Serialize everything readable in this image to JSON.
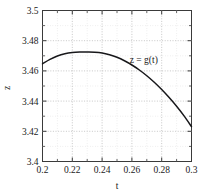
{
  "chart_data": {
    "type": "line",
    "title": "",
    "xlabel": "t",
    "ylabel": "z",
    "xlim": [
      0.2,
      0.3
    ],
    "ylim": [
      3.4,
      3.5
    ],
    "grid": true,
    "legend_position": "inside-right",
    "xticks": [
      "0.2",
      "0.22",
      "0.24",
      "0.26",
      "0.28",
      "0.3"
    ],
    "xtick_values": [
      0.2,
      0.22,
      0.24,
      0.26,
      0.28,
      0.3
    ],
    "yticks": [
      "3.4",
      "3.42",
      "3.44",
      "3.46",
      "3.48",
      "3.5"
    ],
    "ytick_values": [
      3.4,
      3.42,
      3.44,
      3.46,
      3.48,
      3.5
    ],
    "annotations": [
      {
        "text": "z = g(t)",
        "x": 0.268,
        "y": 3.4655
      }
    ],
    "series": [
      {
        "name": "z = g(t)",
        "color": "#17171a",
        "x": [
          0.2,
          0.205,
          0.21,
          0.215,
          0.22,
          0.225,
          0.23,
          0.235,
          0.24,
          0.245,
          0.25,
          0.255,
          0.26,
          0.265,
          0.27,
          0.275,
          0.28,
          0.285,
          0.29,
          0.295,
          0.3
        ],
        "y": [
          3.4647,
          3.4676,
          3.4699,
          3.4714,
          3.4722,
          3.4725,
          3.4725,
          3.4724,
          3.4719,
          3.4707,
          3.469,
          3.4667,
          3.4639,
          3.4606,
          3.4568,
          3.4525,
          3.4477,
          3.4424,
          3.4366,
          3.4302,
          3.4231
        ]
      }
    ]
  },
  "axis_labels": {
    "x": "t",
    "y": "z"
  },
  "colors": {
    "curve": "#17171a",
    "frame": "#3a3a3a",
    "grid": "#b9b9b9",
    "background": "#ffffff"
  }
}
